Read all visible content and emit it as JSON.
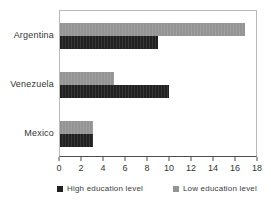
{
  "chart_data": {
    "type": "bar",
    "orientation": "horizontal",
    "title": "",
    "xlabel": "",
    "ylabel": "",
    "categories": [
      "Argentina",
      "Venezuela",
      "Mexico"
    ],
    "series": [
      {
        "name": "High education level",
        "color": "#212121",
        "values": [
          9,
          10,
          3
        ]
      },
      {
        "name": "Low education level",
        "color": "#949494",
        "values": [
          17,
          5,
          3
        ]
      }
    ],
    "group_order_top_to_bottom": [
      "Low education level",
      "High education level"
    ],
    "xlim": [
      0,
      18
    ],
    "xticks": [
      0,
      2,
      4,
      6,
      8,
      10,
      12,
      14,
      16,
      18
    ],
    "grid": false,
    "legend_position": "bottom",
    "colors": {
      "plot_border": "#b9b9b9",
      "axis_line": "#4d4d4d",
      "text": "#3d3d3d",
      "background": "#ffffff"
    }
  }
}
